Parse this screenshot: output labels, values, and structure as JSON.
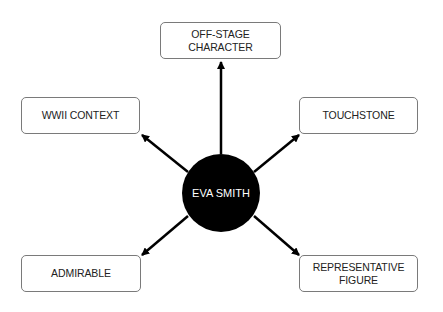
{
  "center": {
    "label": "EVA SMITH"
  },
  "nodes": [
    {
      "id": "top",
      "label": "OFF-STAGE CHARACTER"
    },
    {
      "id": "top-left",
      "label": "WWII CONTEXT"
    },
    {
      "id": "top-right",
      "label": "TOUCHSTONE"
    },
    {
      "id": "bottom-left",
      "label": "ADMIRABLE"
    },
    {
      "id": "bottom-right",
      "label": "REPRESENTATIVE FIGURE"
    }
  ],
  "colors": {
    "center_fill": "#000000",
    "arrow": "#000000",
    "box_border": "#7a7a7a"
  }
}
